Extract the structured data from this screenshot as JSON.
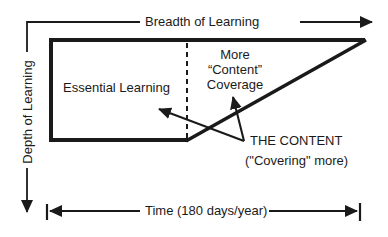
{
  "diagram": {
    "axes": {
      "horizontal_label": "Breadth of Learning",
      "vertical_label": "Depth of Learning",
      "time_label": "Time (180 days/year)"
    },
    "regions": {
      "essential": "Essential Learning",
      "more_line1": "More",
      "more_line2": "“Content”",
      "more_line3": "Coverage"
    },
    "callout": {
      "title": "THE CONTENT",
      "subtitle": "(\"Covering\" more)"
    },
    "colors": {
      "stroke": "#1a1a1a",
      "background": "#ffffff"
    }
  }
}
